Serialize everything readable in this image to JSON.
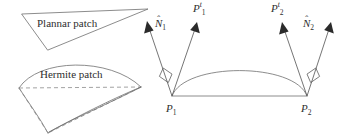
{
  "figure": {
    "background_color": "#ffffff",
    "line_color": "#6e6e6e",
    "dash_color": "#8a8a8a",
    "text_color": "#2e2e2e",
    "arrow_fill": "#2b2b2b"
  },
  "left_panel": {
    "planar_patch": {
      "label": "Plannar patch",
      "shape": "triangle"
    },
    "hermite_patch": {
      "label": "Hermite patch",
      "shape": "curved-triangle"
    }
  },
  "right_panel": {
    "endpoints": [
      {
        "id": "p1",
        "label_base": "P",
        "label_sub": "1"
      },
      {
        "id": "p2",
        "label_base": "P",
        "label_sub": "2"
      }
    ],
    "tangents": [
      {
        "id": "pt1",
        "label_base": "P",
        "label_sub": "1",
        "label_sup": "t"
      },
      {
        "id": "pt2",
        "label_base": "P",
        "label_sub": "2",
        "label_sup": "t"
      }
    ],
    "normals": [
      {
        "id": "nhat1",
        "label_base": "N",
        "label_sub": "1",
        "hat": "̂"
      },
      {
        "id": "nhat2",
        "label_base": "N",
        "label_sub": "2",
        "hat": "̂"
      }
    ],
    "right_angle_markers": 2,
    "baseline": "chord from P1 to P2",
    "curve": "Hermite arc from P1 to P2"
  }
}
